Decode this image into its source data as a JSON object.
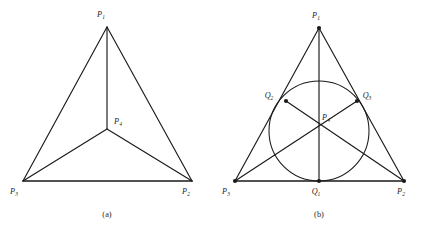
{
  "figure": {
    "panels": [
      {
        "id": "a",
        "caption": "(a)",
        "caption_pos": {
          "x": 107,
          "y": 214
        },
        "description": "Triangle subdivided into three sub-triangles by segments from an interior point",
        "vertices": [
          {
            "name": "P1",
            "label": "P",
            "subscript": "1",
            "x": 107,
            "y": 27,
            "label_x": 101,
            "label_y": 17,
            "dot": false
          },
          {
            "name": "P2",
            "label": "P",
            "subscript": "2",
            "x": 192,
            "y": 181,
            "label_x": 186,
            "label_y": 194,
            "dot": false
          },
          {
            "name": "P3",
            "label": "P",
            "subscript": "3",
            "x": 23,
            "y": 181,
            "label_x": 11,
            "label_y": 194,
            "dot": false
          },
          {
            "name": "P4",
            "label": "P",
            "subscript": "4",
            "x": 107,
            "y": 129,
            "label_x": 115,
            "label_y": 124,
            "dot": false
          }
        ],
        "outer_edges": [
          {
            "name": "edge-P1-P2",
            "from": "P1",
            "to": "P2",
            "weight": "thin"
          },
          {
            "name": "edge-P1-P3",
            "from": "P1",
            "to": "P3",
            "weight": "thin"
          },
          {
            "name": "edge-P3-P2",
            "from": "P3",
            "to": "P2",
            "weight": "thick"
          }
        ],
        "inner_edges": [
          {
            "name": "segment-P4-P1",
            "from": "P4",
            "to": "P1"
          },
          {
            "name": "segment-P4-P2",
            "from": "P4",
            "to": "P2"
          },
          {
            "name": "segment-P4-P3",
            "from": "P4",
            "to": "P3"
          }
        ]
      },
      {
        "id": "b",
        "caption": "(b)",
        "caption_pos": {
          "x": 107,
          "y": 214
        },
        "description": "Triangle with inscribed circle tangent to each side, cevians from vertices to opposite tangency points meeting at the incenter",
        "vertices": [
          {
            "name": "P1",
            "label": "P",
            "subscript": "1",
            "x": 107,
            "y": 28,
            "label_x": 101,
            "label_y": 18,
            "dot": true
          },
          {
            "name": "P2",
            "label": "P",
            "subscript": "2",
            "x": 192,
            "y": 181,
            "label_x": 186,
            "label_y": 194,
            "dot": true
          },
          {
            "name": "P3",
            "label": "P",
            "subscript": "3",
            "x": 23,
            "y": 181,
            "label_x": 11,
            "label_y": 194,
            "dot": true
          },
          {
            "name": "P4",
            "label": "P",
            "subscript": "4",
            "x": 107,
            "y": 131,
            "label_x": 112,
            "label_y": 118,
            "dot": false
          }
        ],
        "tangency_points": [
          {
            "name": "Q1",
            "label": "Q",
            "subscript": "1",
            "x": 107,
            "y": 181,
            "label_x": 101,
            "label_y": 194,
            "dot": true
          },
          {
            "name": "Q2",
            "label": "Q",
            "subscript": "2",
            "x": 74,
            "y": 101,
            "label_x": 54,
            "label_y": 98,
            "dot": true
          },
          {
            "name": "Q3",
            "label": "Q",
            "subscript": "3",
            "x": 145,
            "y": 101,
            "label_x": 150,
            "label_y": 98,
            "dot": true
          }
        ],
        "incircle": {
          "name": "incircle",
          "cx": 107,
          "cy": 131,
          "r": 50
        },
        "outer_edges": [
          {
            "name": "edge-P1-P2",
            "from": "P1",
            "to": "P2",
            "weight": "thin"
          },
          {
            "name": "edge-P1-P3",
            "from": "P1",
            "to": "P3",
            "weight": "thin"
          },
          {
            "name": "edge-P3-P2",
            "from": "P3",
            "to": "P2",
            "weight": "thick"
          }
        ],
        "cevians": [
          {
            "name": "cevian-P1-Q1",
            "from": "P1",
            "to": "Q1"
          },
          {
            "name": "cevian-P2-Q2",
            "from": "P2",
            "to": "Q2"
          },
          {
            "name": "cevian-P3-Q3",
            "from": "P3",
            "to": "Q3"
          }
        ]
      }
    ]
  },
  "style": {
    "line_color": "#1a1a1a",
    "text_color": "#262626",
    "background": "#ffffff"
  }
}
